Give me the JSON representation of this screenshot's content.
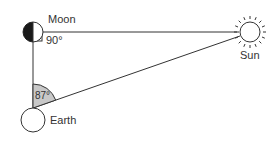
{
  "diagram": {
    "bodies": {
      "moon": {
        "label": "Moon",
        "angle_label": "90°"
      },
      "earth": {
        "label": "Earth",
        "angle_label": "87°"
      },
      "sun": {
        "label": "Sun"
      }
    },
    "colors": {
      "line": "#333333",
      "moon_dark": "#1a1a1a",
      "angle_fill": "#c8c8c8"
    }
  }
}
